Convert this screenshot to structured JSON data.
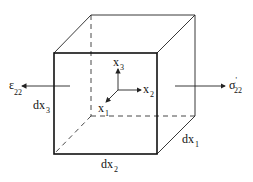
{
  "diagram": {
    "type": "cube-stress-element",
    "colors": {
      "line": "#222222",
      "background": "#ffffff"
    },
    "labels": {
      "strain": {
        "base": "ε",
        "sub": "22"
      },
      "stress": {
        "base": "σ",
        "sup": "'",
        "sub": "22"
      },
      "dx1": {
        "base": "dx",
        "sub": "1"
      },
      "dx2": {
        "base": "dx",
        "sub": "2"
      },
      "dx3": {
        "base": "dx",
        "sub": "3"
      },
      "axis_x1": {
        "base": "x",
        "sub": "1"
      },
      "axis_x2": {
        "base": "x",
        "sub": "2"
      },
      "axis_x3": {
        "base": "x",
        "sub": "3"
      }
    }
  }
}
